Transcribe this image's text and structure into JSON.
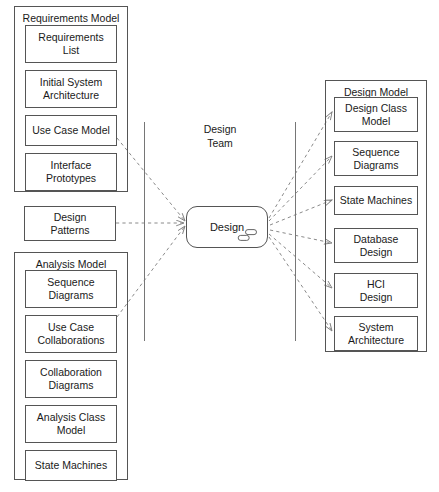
{
  "diagram": {
    "packages": [
      {
        "id": "requirements-model",
        "label": "Requirements Model",
        "items": [
          {
            "label": "Requirements\nList"
          },
          {
            "label": "Initial System\nArchitecture"
          },
          {
            "label": "Use Case Model"
          },
          {
            "label": "Interface\nPrototypes"
          }
        ]
      },
      {
        "id": "analysis-model",
        "label": "Analysis Model",
        "items": [
          {
            "label": "Sequence\nDiagrams"
          },
          {
            "label": "Use Case\nCollaborations"
          },
          {
            "label": "Collaboration\nDiagrams"
          },
          {
            "label": "Analysis Class\nModel"
          },
          {
            "label": "State Machines"
          }
        ]
      },
      {
        "id": "design-model",
        "label": "Design Model",
        "items": [
          {
            "label": "Design Class\nModel"
          },
          {
            "label": "Sequence\nDiagrams"
          },
          {
            "label": "State Machines"
          },
          {
            "label": "Database\nDesign"
          },
          {
            "label": "HCI\nDesign"
          },
          {
            "label": "System\nArchitecture"
          }
        ]
      }
    ],
    "standalone_nodes": [
      {
        "id": "design-patterns",
        "label": "Design\nPatterns"
      }
    ],
    "lane": {
      "label": "Design\nTeam"
    },
    "activity": {
      "label": "Design",
      "icon": "subactivity-rake-icon"
    },
    "colors": {
      "stroke": "#555555",
      "lane_stroke": "#767676",
      "edge_stroke": "#8a8a8a",
      "text": "#1a1a1a",
      "background": "#ffffff"
    },
    "edges": {
      "style": "dashed",
      "inputs": [
        {
          "from": "Use Case Model",
          "to": "Design"
        },
        {
          "from": "Design Patterns",
          "to": "Design"
        },
        {
          "from": "Use Case Collaborations",
          "to": "Design"
        }
      ],
      "outputs": [
        {
          "from": "Design",
          "to": "Design Class Model"
        },
        {
          "from": "Design",
          "to": "Sequence Diagrams"
        },
        {
          "from": "Design",
          "to": "State Machines"
        },
        {
          "from": "Design",
          "to": "Database Design"
        },
        {
          "from": "Design",
          "to": "HCI Design"
        },
        {
          "from": "Design",
          "to": "System Architecture"
        }
      ]
    }
  }
}
